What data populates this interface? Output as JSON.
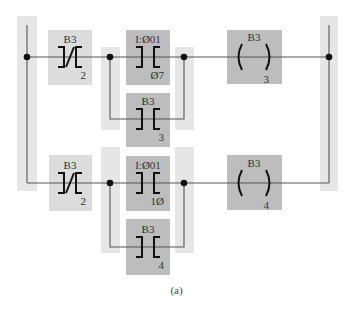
{
  "colors": {
    "band": "#e6e6e6",
    "light_box": "#dcdcdc",
    "dark_box": "#bdbdbd",
    "wire": "#555555",
    "symbol": "#111111"
  },
  "caption": "(a)",
  "rungs": [
    {
      "name": "rung-1",
      "input_contact": {
        "type": "XIO",
        "file": "B3",
        "bit": "2"
      },
      "branch": [
        {
          "type": "XIC",
          "file": "I:Ø01",
          "bit": "Ø7"
        },
        {
          "type": "XIC",
          "file": "B3",
          "bit": "3"
        }
      ],
      "output": {
        "type": "OTE",
        "file": "B3",
        "bit": "3"
      }
    },
    {
      "name": "rung-2",
      "input_contact": {
        "type": "XIO",
        "file": "B3",
        "bit": "2"
      },
      "branch": [
        {
          "type": "XIC",
          "file": "I:Ø01",
          "bit": "1Ø"
        },
        {
          "type": "XIC",
          "file": "B3",
          "bit": "4"
        }
      ],
      "output": {
        "type": "OTE",
        "file": "B3",
        "bit": "4"
      }
    }
  ]
}
